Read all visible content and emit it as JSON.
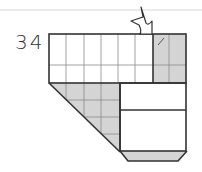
{
  "puzzle": {
    "clue_number": "34",
    "colors": {
      "shaded": "#d4d4d4",
      "border": "#333333",
      "grid_line": "#8a8a8a",
      "rule_line": "#d8d8d8",
      "background": "#ffffff"
    },
    "top_band": {
      "columns": 8,
      "rows": 2,
      "white_columns": 6,
      "shaded_columns": 2
    },
    "lower_left_triangle": {
      "shaded": true,
      "grid_columns": 4,
      "grid_rows": 4
    },
    "lower_right_boxes": {
      "count": 2,
      "shaded": false
    },
    "bottom_strip": {
      "shaded": true
    },
    "arrow": {
      "icon": "outlined-arrow-down-right-icon"
    },
    "mark": {
      "icon": "slash-mark-icon"
    }
  }
}
